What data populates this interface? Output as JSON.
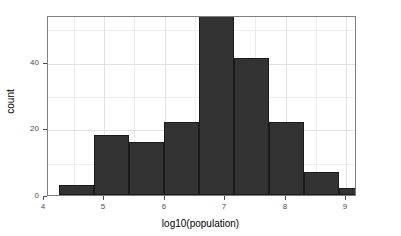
{
  "chart_data": {
    "type": "bar",
    "title": "",
    "subtitle": "",
    "xlabel": "log10(population)",
    "ylabel": "count",
    "xlim": [
      4.07,
      9.18
    ],
    "ylim": [
      0,
      54
    ],
    "grid": true,
    "legend": null,
    "bin_width": 0.578,
    "x_ticks": [
      "4",
      "5",
      "6",
      "7",
      "8",
      "9"
    ],
    "x_tick_values": [
      4,
      5,
      6,
      7,
      8,
      9
    ],
    "y_ticks": [
      "0",
      "20",
      "40"
    ],
    "y_tick_values": [
      0,
      20,
      40
    ],
    "bar_color": "#333333",
    "bar_edge_color": "#1a1a1a",
    "panel_border_color": "#7f7f7f",
    "grid_color": "#ececec",
    "bins": [
      {
        "x_start": 4.25,
        "x_end": 4.83,
        "count": 3
      },
      {
        "x_start": 4.83,
        "x_end": 5.41,
        "count": 18
      },
      {
        "x_start": 5.41,
        "x_end": 5.99,
        "count": 16
      },
      {
        "x_start": 5.99,
        "x_end": 6.57,
        "count": 22
      },
      {
        "x_start": 6.57,
        "x_end": 7.15,
        "count": 54
      },
      {
        "x_start": 7.15,
        "x_end": 7.73,
        "count": 41
      },
      {
        "x_start": 7.73,
        "x_end": 8.31,
        "count": 22
      },
      {
        "x_start": 8.31,
        "x_end": 8.89,
        "count": 7
      },
      {
        "x_start": 8.89,
        "x_end": 9.47,
        "count": 2
      },
      {
        "x_start": 9.47,
        "x_end": 10.05,
        "count": 1
      }
    ],
    "categories": [
      "4.25-4.83",
      "4.83-5.41",
      "5.41-5.99",
      "5.99-6.57",
      "6.57-7.15",
      "7.15-7.73",
      "7.73-8.31",
      "8.31-8.89",
      "8.89-9.47",
      "9.47-10.05"
    ],
    "values": [
      3,
      18,
      16,
      22,
      54,
      41,
      22,
      7,
      2,
      1
    ]
  }
}
